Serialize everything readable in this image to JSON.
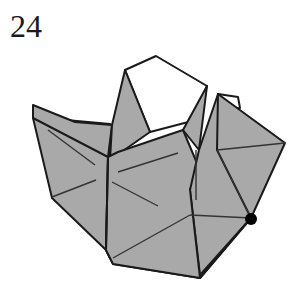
{
  "step": {
    "number": "24"
  },
  "diagram": {
    "colors": {
      "paper_shaded": "#a9a9a9",
      "paper_white": "#ffffff",
      "line": "#1a1a1a",
      "marker": "#000000"
    },
    "marker": {
      "type": "dot",
      "x": 251,
      "y": 219
    }
  }
}
